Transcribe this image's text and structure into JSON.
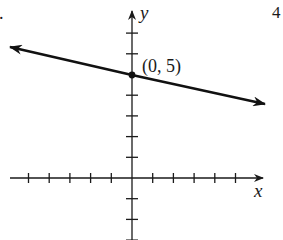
{
  "problem": {
    "left_marker": ".",
    "right_marker": "4"
  },
  "axes": {
    "x_label": "x",
    "y_label": "y",
    "unit_px": 20.7,
    "origin_px": [
      132,
      178
    ],
    "x_ticks": [
      -5,
      -4,
      -3,
      -2,
      -1,
      1,
      2,
      3,
      4,
      5
    ],
    "y_ticks": [
      -3,
      -2,
      -1,
      1,
      2,
      3,
      4,
      6,
      7
    ],
    "color": "#1a1a1a"
  },
  "line": {
    "point_label": "(0, 5)",
    "point": [
      0,
      5
    ],
    "slope_estimate": -0.22,
    "left_end": [
      -5.9,
      6.33
    ],
    "right_end": [
      6.4,
      3.57
    ],
    "color": "#111111"
  },
  "chart_data": {
    "type": "line",
    "title": "",
    "xlabel": "x",
    "ylabel": "y",
    "xlim": [
      -6,
      6.5
    ],
    "ylim": [
      -3,
      8
    ],
    "grid": false,
    "series": [
      {
        "name": "line through (0, 5)",
        "x": [
          -5.9,
          0,
          6.4
        ],
        "y": [
          6.33,
          5,
          3.57
        ],
        "arrows_both_ends": true
      }
    ],
    "annotations": [
      {
        "text": "(0, 5)",
        "x": 0,
        "y": 5,
        "marker": "dot"
      }
    ],
    "x_ticks": [
      -5,
      -4,
      -3,
      -2,
      -1,
      0,
      1,
      2,
      3,
      4,
      5
    ],
    "y_ticks": [
      -3,
      -2,
      -1,
      0,
      1,
      2,
      3,
      4,
      5,
      6,
      7
    ]
  }
}
